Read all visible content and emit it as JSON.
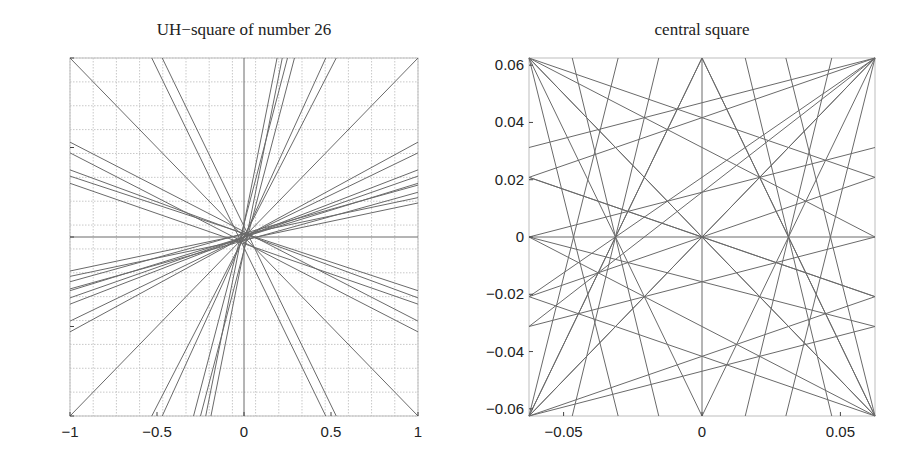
{
  "chart_data": [
    {
      "type": "line",
      "title": "UH−square of number 26",
      "xlabel": "",
      "ylabel": "",
      "xlim": [
        -1,
        1
      ],
      "ylim": [
        -1,
        1
      ],
      "grid": true,
      "grid_step": 0.13333,
      "xticks": [
        -1,
        -0.5,
        0,
        0.5,
        1
      ],
      "xtick_labels": [
        "−1",
        "−0.5",
        "0",
        "0.5",
        "1"
      ],
      "yticks": [
        -1,
        -0.5,
        0,
        0.5,
        1
      ],
      "ytick_labels": [
        "−1",
        "−0.5",
        "0",
        "0.5",
        "1"
      ],
      "segments": [
        [
          [
            -1,
            1
          ],
          [
            1,
            -1
          ]
        ],
        [
          [
            -1,
            -1
          ],
          [
            1,
            1
          ]
        ],
        [
          [
            0,
            1
          ],
          [
            0,
            -1
          ]
        ],
        [
          [
            -1,
            0
          ],
          [
            1,
            0
          ]
        ],
        [
          [
            -0.53,
            1
          ],
          [
            0.47,
            -1
          ]
        ],
        [
          [
            -0.47,
            1
          ],
          [
            0.53,
            -1
          ]
        ],
        [
          [
            0.19,
            1
          ],
          [
            -0.22,
            -1
          ]
        ],
        [
          [
            0.22,
            1
          ],
          [
            -0.19,
            -1
          ]
        ],
        [
          [
            0.25,
            1
          ],
          [
            -0.29,
            -1
          ]
        ],
        [
          [
            0.29,
            1
          ],
          [
            -0.25,
            -1
          ]
        ],
        [
          [
            0.47,
            1
          ],
          [
            -0.47,
            -1
          ]
        ],
        [
          [
            0.53,
            1
          ],
          [
            -0.53,
            -1
          ]
        ],
        [
          [
            -1,
            0.53
          ],
          [
            1,
            -0.47
          ]
        ],
        [
          [
            -1,
            0.47
          ],
          [
            1,
            -0.53
          ]
        ],
        [
          [
            -1,
            0.375
          ],
          [
            1,
            -0.34
          ]
        ],
        [
          [
            -1,
            0.34
          ],
          [
            1,
            -0.3
          ]
        ],
        [
          [
            -1,
            0.3
          ],
          [
            1,
            -0.375
          ]
        ],
        [
          [
            -1,
            -0.19
          ],
          [
            1,
            0.22
          ]
        ],
        [
          [
            -1,
            -0.22
          ],
          [
            1,
            0.19
          ]
        ],
        [
          [
            -1,
            -0.25
          ],
          [
            1,
            0.29
          ]
        ],
        [
          [
            -1,
            -0.29
          ],
          [
            1,
            0.25
          ]
        ],
        [
          [
            -1,
            -0.3
          ],
          [
            1,
            0.3
          ]
        ],
        [
          [
            -1,
            -0.34
          ],
          [
            1,
            0.34
          ]
        ],
        [
          [
            -1,
            -0.375
          ],
          [
            1,
            0.375
          ]
        ],
        [
          [
            -1,
            -0.47
          ],
          [
            1,
            0.47
          ]
        ],
        [
          [
            -1,
            -0.53
          ],
          [
            1,
            0.53
          ]
        ]
      ]
    },
    {
      "type": "line",
      "title": "central square",
      "xlabel": "",
      "ylabel": "",
      "xlim": [
        -0.0625,
        0.0625
      ],
      "ylim": [
        -0.0625,
        0.0625
      ],
      "grid": false,
      "xticks": [
        -0.05,
        0,
        0.05
      ],
      "xtick_labels": [
        "−0.05",
        "0",
        "0.05"
      ],
      "yticks": [
        -0.06,
        -0.04,
        -0.02,
        0,
        0.02,
        0.04,
        0.06
      ],
      "ytick_labels": [
        "−0.06",
        "−0.04",
        "−0.02",
        "0",
        "0.02",
        "0.04",
        "0.06"
      ],
      "segments": [
        [
          [
            -0.0625,
            0.0625
          ],
          [
            0.0625,
            -0.0625
          ]
        ],
        [
          [
            -0.0625,
            -0.0625
          ],
          [
            0.0625,
            0.0625
          ]
        ],
        [
          [
            0,
            0.0625
          ],
          [
            0,
            -0.0625
          ]
        ],
        [
          [
            -0.0625,
            0
          ],
          [
            0.0625,
            0
          ]
        ],
        [
          [
            -0.0625,
            0.0625
          ],
          [
            -0.03125,
            0
          ]
        ],
        [
          [
            -0.0625,
            0.0625
          ],
          [
            0,
            0
          ]
        ],
        [
          [
            -0.0625,
            0.0625
          ],
          [
            0.0625,
            0.02083
          ]
        ],
        [
          [
            -0.0625,
            0.0625
          ],
          [
            0.0625,
            0
          ]
        ],
        [
          [
            0.0625,
            0.0625
          ],
          [
            0.03125,
            0
          ]
        ],
        [
          [
            0.0625,
            0.0625
          ],
          [
            0,
            0
          ]
        ],
        [
          [
            0.0625,
            0.0625
          ],
          [
            -0.0625,
            0.02083
          ]
        ],
        [
          [
            0.0625,
            0.0625
          ],
          [
            -0.0625,
            0.03125
          ]
        ],
        [
          [
            -0.0625,
            -0.0625
          ],
          [
            -0.03125,
            0
          ]
        ],
        [
          [
            -0.0625,
            -0.0625
          ],
          [
            0,
            0
          ]
        ],
        [
          [
            -0.0625,
            -0.0625
          ],
          [
            0.0625,
            -0.02083
          ]
        ],
        [
          [
            -0.0625,
            -0.0625
          ],
          [
            0.0625,
            -0.03125
          ]
        ],
        [
          [
            0.0625,
            -0.0625
          ],
          [
            0.03125,
            0
          ]
        ],
        [
          [
            0.0625,
            -0.0625
          ],
          [
            0,
            0
          ]
        ],
        [
          [
            0.0625,
            -0.0625
          ],
          [
            -0.0625,
            -0.02083
          ]
        ],
        [
          [
            0.0625,
            -0.0625
          ],
          [
            -0.0625,
            0
          ]
        ],
        [
          [
            0,
            0.0625
          ],
          [
            -0.03125,
            0
          ]
        ],
        [
          [
            0,
            0.0625
          ],
          [
            0.03125,
            0
          ]
        ],
        [
          [
            0,
            0.0625
          ],
          [
            -0.0625,
            -0.0625
          ]
        ],
        [
          [
            0,
            0.0625
          ],
          [
            0.0625,
            -0.0625
          ]
        ],
        [
          [
            0,
            -0.0625
          ],
          [
            -0.03125,
            0
          ]
        ],
        [
          [
            0,
            -0.0625
          ],
          [
            0.03125,
            0
          ]
        ],
        [
          [
            -0.0625,
            0
          ],
          [
            0.0625,
            0.03125
          ]
        ],
        [
          [
            -0.0625,
            0
          ],
          [
            0.0625,
            -0.03125
          ]
        ],
        [
          [
            -0.0625,
            -0.02083
          ],
          [
            0.0625,
            0.0625
          ]
        ],
        [
          [
            -0.0625,
            -0.03125
          ],
          [
            0.0625,
            0.0625
          ]
        ],
        [
          [
            0.0625,
            0
          ],
          [
            -0.0625,
            -0.03125
          ]
        ],
        [
          [
            -0.0625,
            0.02083
          ],
          [
            0,
            0
          ]
        ],
        [
          [
            0.0625,
            -0.02083
          ],
          [
            0,
            0
          ]
        ],
        [
          [
            -0.0625,
            -0.02083
          ],
          [
            0.0625,
            0.02083
          ]
        ],
        [
          [
            -0.0625,
            0.02083
          ],
          [
            0.0625,
            -0.02083
          ]
        ],
        [
          [
            -0.015625,
            0.0625
          ],
          [
            -0.046875,
            -0.0625
          ]
        ],
        [
          [
            0.046875,
            0.0625
          ],
          [
            0.015625,
            -0.0625
          ]
        ],
        [
          [
            -0.046875,
            0.0625
          ],
          [
            -0.015625,
            -0.0625
          ]
        ],
        [
          [
            0.015625,
            0.0625
          ],
          [
            0.046875,
            -0.0625
          ]
        ],
        [
          [
            -0.0303,
            0.0625
          ],
          [
            -0.0625,
            -0.0625
          ]
        ],
        [
          [
            0.0625,
            0.0625
          ],
          [
            0.0303,
            -0.0625
          ]
        ],
        [
          [
            -0.0625,
            0.0625
          ],
          [
            -0.0303,
            -0.0625
          ]
        ],
        [
          [
            0.0303,
            0.0625
          ],
          [
            0.0625,
            -0.0625
          ]
        ]
      ]
    }
  ]
}
